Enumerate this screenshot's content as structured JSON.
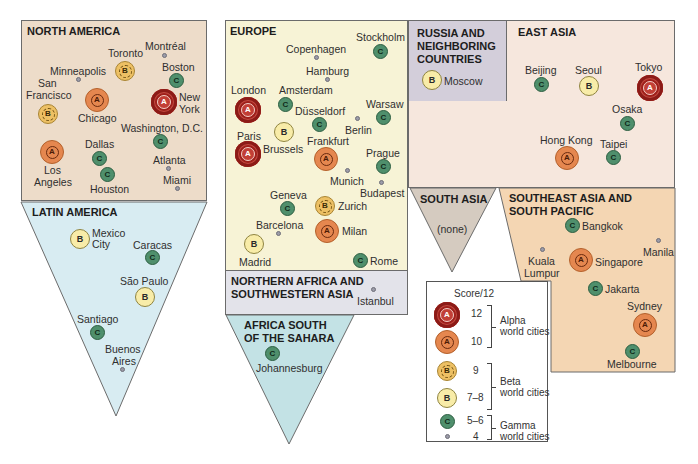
{
  "figure": {
    "regions": {
      "north_america": {
        "title": "NORTH AMERICA",
        "cities": [
          {
            "name": "Montréal",
            "class": "4"
          },
          {
            "name": "Toronto",
            "class": "B9"
          },
          {
            "name": "Minneapolis",
            "class": "4"
          },
          {
            "name": "Boston",
            "class": "C"
          },
          {
            "name": "San Francisco",
            "class": "B9"
          },
          {
            "name": "Chicago",
            "class": "A10"
          },
          {
            "name": "New York",
            "class": "A12"
          },
          {
            "name": "Washington, D.C.",
            "class": "C"
          },
          {
            "name": "Los Angeles",
            "class": "A10"
          },
          {
            "name": "Dallas",
            "class": "C"
          },
          {
            "name": "Houston",
            "class": "C"
          },
          {
            "name": "Atlanta",
            "class": "4"
          },
          {
            "name": "Miami",
            "class": "4"
          }
        ]
      },
      "latin_america": {
        "title": "LATIN AMERICA",
        "cities": [
          {
            "name": "Mexico City",
            "class": "B78"
          },
          {
            "name": "Caracas",
            "class": "C"
          },
          {
            "name": "São Paulo",
            "class": "B78"
          },
          {
            "name": "Santiago",
            "class": "C"
          },
          {
            "name": "Buenos Aires",
            "class": "4"
          }
        ]
      },
      "europe": {
        "title": "EUROPE",
        "cities": [
          {
            "name": "Stockholm",
            "class": "C"
          },
          {
            "name": "Copenhagen",
            "class": "4"
          },
          {
            "name": "Hamburg",
            "class": "4"
          },
          {
            "name": "London",
            "class": "A12"
          },
          {
            "name": "Amsterdam",
            "class": "C"
          },
          {
            "name": "Düsseldorf",
            "class": "C"
          },
          {
            "name": "Warsaw",
            "class": "C"
          },
          {
            "name": "Berlin",
            "class": "4"
          },
          {
            "name": "Paris",
            "class": "A12"
          },
          {
            "name": "Brussels",
            "class": "B78"
          },
          {
            "name": "Frankfurt",
            "class": "A10"
          },
          {
            "name": "Prague",
            "class": "C"
          },
          {
            "name": "Munich",
            "class": "4"
          },
          {
            "name": "Budapest",
            "class": "4"
          },
          {
            "name": "Geneva",
            "class": "C"
          },
          {
            "name": "Zurich",
            "class": "B9"
          },
          {
            "name": "Barcelona",
            "class": "4"
          },
          {
            "name": "Milan",
            "class": "A10"
          },
          {
            "name": "Madrid",
            "class": "B78"
          },
          {
            "name": "Rome",
            "class": "C"
          }
        ]
      },
      "northern_africa": {
        "title_line1": "NORTHERN AFRICA AND",
        "title_line2": "SOUTHWESTERN ASIA",
        "cities": [
          {
            "name": "Istanbul",
            "class": "4"
          }
        ]
      },
      "africa_south": {
        "title_line1": "AFRICA SOUTH",
        "title_line2": "OF THE SAHARA",
        "cities": [
          {
            "name": "Johannesburg",
            "class": "C"
          }
        ]
      },
      "russia": {
        "title_line1": "RUSSIA AND",
        "title_line2": "NEIGHBORING",
        "title_line3": "COUNTRIES",
        "cities": [
          {
            "name": "Moscow",
            "class": "B78"
          }
        ]
      },
      "east_asia": {
        "title": "EAST ASIA",
        "cities": [
          {
            "name": "Beijing",
            "class": "C"
          },
          {
            "name": "Seoul",
            "class": "B78"
          },
          {
            "name": "Tokyo",
            "class": "A12"
          },
          {
            "name": "Osaka",
            "class": "C"
          },
          {
            "name": "Hong Kong",
            "class": "A10"
          },
          {
            "name": "Taipei",
            "class": "C"
          }
        ]
      },
      "south_asia": {
        "title": "SOUTH ASIA",
        "none_label": "(none)"
      },
      "southeast_asia": {
        "title_line1": "SOUTHEAST ASIA AND",
        "title_line2": "SOUTH PACIFIC",
        "cities": [
          {
            "name": "Bangkok",
            "class": "C"
          },
          {
            "name": "Kuala Lumpur",
            "class": "4"
          },
          {
            "name": "Manila",
            "class": "4"
          },
          {
            "name": "Singapore",
            "class": "A10"
          },
          {
            "name": "Jakarta",
            "class": "C"
          },
          {
            "name": "Sydney",
            "class": "A10"
          },
          {
            "name": "Melbourne",
            "class": "C"
          }
        ]
      }
    },
    "symbols": {
      "alpha": "A",
      "beta": "B",
      "gamma": "C"
    },
    "legend": {
      "heading": "Score/12",
      "rows": [
        {
          "score": "12",
          "symbol": "A"
        },
        {
          "score": "10",
          "symbol": "A"
        },
        {
          "score": "9",
          "symbol": "B"
        },
        {
          "score": "7–8",
          "symbol": "B"
        },
        {
          "score": "5–6",
          "symbol": "C"
        },
        {
          "score": "4",
          "symbol": ""
        }
      ],
      "groups": [
        {
          "line1": "Alpha",
          "line2": "world cities"
        },
        {
          "line1": "Beta",
          "line2": "world cities"
        },
        {
          "line1": "Gamma",
          "line2": "world cities"
        }
      ]
    },
    "colors": {
      "north_america_bg": "#eddcc9",
      "latin_america_bg": "#d8ecf2",
      "europe_bg": "#f7f3d6",
      "northern_africa_bg": "#e3e3ea",
      "africa_south_bg": "#c3e2e5",
      "russia_bg": "#d3ceda",
      "east_asia_bg": "#f6e7dd",
      "south_asia_bg": "#d5cbc0",
      "southeast_asia_bg": "#f4d6b3",
      "alpha12": "#a6241f",
      "alpha10": "#e5874f",
      "beta9": "#edc064",
      "beta78": "#f8eca8",
      "gamma": "#4f8f6c",
      "minor": "#9b9ba8"
    }
  }
}
